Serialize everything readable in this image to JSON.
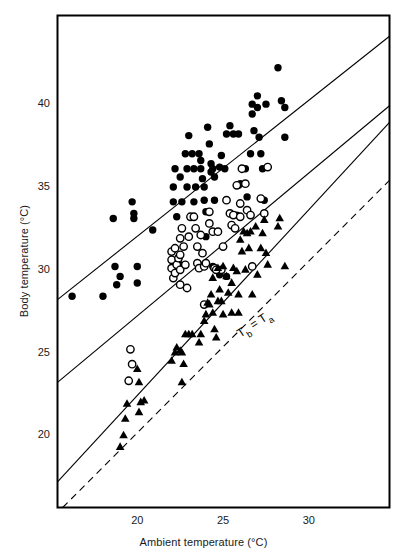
{
  "figure": {
    "title": "",
    "background": "#ffffff",
    "width": 407,
    "height": 557
  },
  "axes": {
    "x_title": "Ambient temperature (°C)",
    "y_title": "Body temperature (°C)",
    "x_ticks": [
      20,
      25,
      30
    ],
    "y_ticks": [
      20,
      25,
      30,
      35,
      40
    ],
    "x_tick_labels": [
      "20",
      "25",
      "30"
    ],
    "y_tick_labels": [
      "20",
      "25",
      "30",
      "35",
      "40"
    ],
    "frame_color": "#000000"
  },
  "annotations": [
    {
      "name": "identity-line-label",
      "text": "Tb = Ta",
      "text_parts": {
        "lead": "T",
        "sub1": "b",
        "eq": " = T",
        "sub2": "a"
      },
      "x": 26.0,
      "y": 25.9,
      "rotation": -33
    }
  ],
  "chart_data": {
    "type": "scatter",
    "title": "",
    "xlabel": "Ambient temperature (°C)",
    "ylabel": "Body temperature (°C)",
    "xlim": [
      15.35,
      34.7
    ],
    "ylim": [
      15.65,
      45.35
    ],
    "xticks": [
      20,
      25,
      30
    ],
    "yticks": [
      20,
      25,
      30,
      35,
      40
    ],
    "grid": false,
    "legend": null,
    "series": [
      {
        "name": "filled-circles",
        "marker": "filled-circle",
        "color": "#000000",
        "points": [
          [
            16.2,
            28.4
          ],
          [
            18.0,
            28.4
          ],
          [
            18.7,
            30.2
          ],
          [
            19.0,
            29.6
          ],
          [
            18.8,
            29.1
          ],
          [
            20.0,
            30.2
          ],
          [
            20.0,
            29.2
          ],
          [
            18.6,
            33.1
          ],
          [
            19.7,
            34.1
          ],
          [
            19.8,
            33.4
          ],
          [
            19.8,
            33.1
          ],
          [
            20.9,
            32.4
          ],
          [
            22.1,
            35.0
          ],
          [
            22.1,
            34.1
          ],
          [
            22.2,
            36.1
          ],
          [
            22.5,
            35.6
          ],
          [
            22.6,
            34.1
          ],
          [
            22.3,
            33.2
          ],
          [
            22.8,
            37.0
          ],
          [
            22.9,
            36.1
          ],
          [
            22.9,
            35.0
          ],
          [
            23.0,
            38.1
          ],
          [
            23.2,
            37.0
          ],
          [
            23.3,
            36.1
          ],
          [
            23.4,
            35.0
          ],
          [
            23.3,
            34.1
          ],
          [
            22.5,
            30.3
          ],
          [
            23.6,
            37.0
          ],
          [
            23.7,
            36.6
          ],
          [
            23.7,
            36.1
          ],
          [
            23.8,
            35.5
          ],
          [
            23.9,
            35.0
          ],
          [
            23.9,
            34.2
          ],
          [
            24.0,
            33.5
          ],
          [
            24.0,
            32.0
          ],
          [
            24.1,
            38.6
          ],
          [
            24.2,
            37.6
          ],
          [
            24.3,
            36.4
          ],
          [
            24.3,
            35.9
          ],
          [
            24.4,
            36.1
          ],
          [
            24.5,
            35.6
          ],
          [
            24.5,
            34.2
          ],
          [
            24.4,
            30.2
          ],
          [
            24.8,
            36.2
          ],
          [
            24.9,
            36.9
          ],
          [
            25.1,
            36.1
          ],
          [
            25.2,
            38.2
          ],
          [
            25.4,
            38.7
          ],
          [
            25.6,
            38.2
          ],
          [
            25.9,
            38.2
          ],
          [
            25.8,
            33.3
          ],
          [
            25.9,
            35.1
          ],
          [
            26.0,
            35.2
          ],
          [
            26.3,
            36.1
          ],
          [
            26.4,
            34.4
          ],
          [
            26.6,
            37.0
          ],
          [
            26.7,
            39.4
          ],
          [
            26.7,
            40.0
          ],
          [
            26.8,
            38.4
          ],
          [
            27.0,
            40.5
          ],
          [
            27.0,
            39.8
          ],
          [
            27.1,
            38.0
          ],
          [
            27.2,
            37.0
          ],
          [
            27.3,
            36.1
          ],
          [
            27.4,
            34.2
          ],
          [
            27.5,
            40.0
          ],
          [
            28.2,
            42.2
          ],
          [
            28.4,
            40.2
          ],
          [
            28.6,
            39.8
          ],
          [
            28.6,
            38.0
          ],
          [
            25.2,
            29.6
          ],
          [
            24.8,
            29.7
          ]
        ]
      },
      {
        "name": "open-circles",
        "marker": "open-circle",
        "color": "#000000",
        "points": [
          [
            19.6,
            25.2
          ],
          [
            19.7,
            24.3
          ],
          [
            19.5,
            23.3
          ],
          [
            22.0,
            31.1
          ],
          [
            22.0,
            30.6
          ],
          [
            22.0,
            30.1
          ],
          [
            22.1,
            29.5
          ],
          [
            22.2,
            31.3
          ],
          [
            22.2,
            29.8
          ],
          [
            22.3,
            30.3
          ],
          [
            22.4,
            30.7
          ],
          [
            22.5,
            31.9
          ],
          [
            22.5,
            30.9
          ],
          [
            22.5,
            30.0
          ],
          [
            22.5,
            29.1
          ],
          [
            22.6,
            32.5
          ],
          [
            22.7,
            31.4
          ],
          [
            22.8,
            30.3
          ],
          [
            22.9,
            28.9
          ],
          [
            23.0,
            32.0
          ],
          [
            23.1,
            33.2
          ],
          [
            23.3,
            33.2
          ],
          [
            23.4,
            32.5
          ],
          [
            23.5,
            31.4
          ],
          [
            23.5,
            30.4
          ],
          [
            23.6,
            30.1
          ],
          [
            23.7,
            32.1
          ],
          [
            23.8,
            31.0
          ],
          [
            23.9,
            30.2
          ],
          [
            24.0,
            30.4
          ],
          [
            24.2,
            33.5
          ],
          [
            24.2,
            32.8
          ],
          [
            24.4,
            32.3
          ],
          [
            24.5,
            30.1
          ],
          [
            24.7,
            32.3
          ],
          [
            24.9,
            30.0
          ],
          [
            25.0,
            31.4
          ],
          [
            25.2,
            34.2
          ],
          [
            25.4,
            33.4
          ],
          [
            25.5,
            32.7
          ],
          [
            25.6,
            33.3
          ],
          [
            25.7,
            32.5
          ],
          [
            25.8,
            35.1
          ],
          [
            26.0,
            34.0
          ],
          [
            26.0,
            33.2
          ],
          [
            26.1,
            36.1
          ],
          [
            26.3,
            35.2
          ],
          [
            26.4,
            33.6
          ],
          [
            26.6,
            33.3
          ],
          [
            26.7,
            30.2
          ],
          [
            27.2,
            34.3
          ],
          [
            27.4,
            33.4
          ],
          [
            27.6,
            36.2
          ],
          [
            23.9,
            27.9
          ],
          [
            24.6,
            30.0
          ]
        ]
      },
      {
        "name": "filled-triangles",
        "marker": "filled-triangle",
        "color": "#000000",
        "points": [
          [
            19.0,
            19.3
          ],
          [
            19.2,
            20.0
          ],
          [
            19.3,
            21.0
          ],
          [
            19.4,
            21.9
          ],
          [
            20.1,
            21.4
          ],
          [
            20.2,
            22.0
          ],
          [
            20.1,
            23.2
          ],
          [
            20.0,
            24.0
          ],
          [
            20.4,
            22.1
          ],
          [
            22.0,
            24.5
          ],
          [
            22.2,
            25.0
          ],
          [
            22.3,
            25.3
          ],
          [
            22.5,
            25.1
          ],
          [
            22.6,
            25.0
          ],
          [
            22.8,
            26.1
          ],
          [
            23.0,
            26.1
          ],
          [
            23.2,
            26.1
          ],
          [
            22.7,
            24.3
          ],
          [
            22.6,
            23.2
          ],
          [
            23.6,
            25.6
          ],
          [
            23.7,
            26.1
          ],
          [
            23.9,
            26.9
          ],
          [
            24.0,
            27.3
          ],
          [
            24.1,
            28.0
          ],
          [
            24.2,
            27.9
          ],
          [
            24.3,
            28.5
          ],
          [
            24.4,
            27.4
          ],
          [
            24.5,
            26.4
          ],
          [
            24.6,
            25.9
          ],
          [
            24.7,
            28.1
          ],
          [
            24.8,
            28.8
          ],
          [
            24.9,
            28.1
          ],
          [
            25.0,
            27.3
          ],
          [
            25.2,
            29.6
          ],
          [
            25.3,
            28.6
          ],
          [
            25.5,
            29.2
          ],
          [
            25.5,
            27.4
          ],
          [
            25.6,
            30.1
          ],
          [
            25.8,
            29.9
          ],
          [
            25.9,
            28.5
          ],
          [
            25.9,
            27.4
          ],
          [
            26.0,
            31.8
          ],
          [
            26.1,
            31.1
          ],
          [
            26.2,
            32.3
          ],
          [
            26.3,
            30.0
          ],
          [
            26.4,
            32.2
          ],
          [
            26.5,
            31.3
          ],
          [
            26.6,
            32.3
          ],
          [
            26.7,
            28.5
          ],
          [
            26.9,
            32.6
          ],
          [
            27.0,
            29.7
          ],
          [
            27.2,
            31.3
          ],
          [
            27.3,
            32.2
          ],
          [
            27.4,
            33.0
          ],
          [
            27.5,
            31.0
          ],
          [
            27.6,
            30.3
          ],
          [
            28.2,
            32.6
          ],
          [
            28.3,
            33.1
          ],
          [
            28.6,
            30.2
          ],
          [
            24.7,
            30.1
          ],
          [
            25.0,
            30.2
          ],
          [
            24.4,
            29.5
          ]
        ]
      }
    ],
    "lines": [
      {
        "name": "upper-regression-line",
        "style": "solid",
        "color": "#000000",
        "x1": 15.35,
        "y1": 28.2,
        "x2": 34.7,
        "y2": 44.1
      },
      {
        "name": "middle-regression-line",
        "style": "solid",
        "color": "#000000",
        "x1": 15.35,
        "y1": 23.2,
        "x2": 34.7,
        "y2": 39.9
      },
      {
        "name": "lower-regression-line",
        "style": "solid",
        "color": "#000000",
        "x1": 15.35,
        "y1": 17.2,
        "x2": 34.7,
        "y2": 38.9
      },
      {
        "name": "identity-line",
        "style": "dashed",
        "color": "#000000",
        "x1": 15.65,
        "y1": 15.65,
        "x2": 34.7,
        "y2": 35.4
      }
    ]
  }
}
